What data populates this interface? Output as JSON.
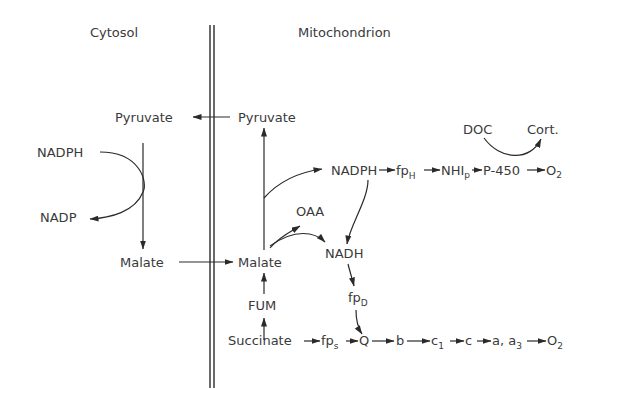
{
  "compartments": {
    "cytosol": "Cytosol",
    "mitochondrion": "Mitochondrion"
  },
  "nodes": {
    "pyruvate_cyto": "Pyruvate",
    "pyruvate_mito": "Pyruvate",
    "nadph_cyto": "NADPH",
    "nadp_cyto": "NADP",
    "malate_cyto": "Malate",
    "malate_mito": "Malate",
    "oaa": "OAA",
    "fum": "FUM",
    "succinate": "Succinate",
    "nadph_mito": "NADPH",
    "nadh": "NADH",
    "fp": "fp",
    "fp_h_sub": "H",
    "fp_d_sub": "D",
    "fp_s_sub": "s",
    "nhi": "NHI",
    "nhi_sub": "p",
    "p450": "P-450",
    "o2_a": "O",
    "o2_sub": "2",
    "doc": "DOC",
    "cort": "Cort.",
    "q": "Q",
    "b": "b",
    "c1": "c",
    "c1_sub": "1",
    "c": "c",
    "a_a3": "a, a",
    "a3_sub": "3",
    "o2_b": "O"
  },
  "pathways": [
    "Pyruvate (mito) -> Pyruvate (cyto)",
    "Malate (cyto) -> Malate (mito)",
    "NADPH -> NADP (cytosol, coupled to Pyruvate -> Malate)",
    "Malate -> Pyruvate (mito)",
    "Malate -> NADPH (mito)",
    "Malate -> OAA / NADH",
    "Succinate -> FUM -> Malate",
    "NADPH -> fpH -> NHIp -> P-450 -> O2",
    "DOC -> Cort. (via P-450)",
    "NADPH -> NADH -> fpD -> Q",
    "Succinate -> fps -> Q -> b -> c1 -> c -> a, a3 -> O2"
  ]
}
